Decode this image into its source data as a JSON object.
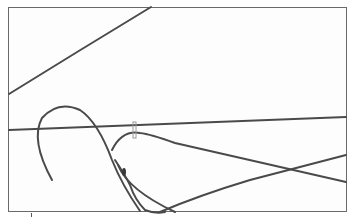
{
  "image": {
    "subject": "wire hangers",
    "description": "Line illustration of tangled wire coat hangers inside a thin rectangular frame",
    "colors": {
      "wire": "#4a4a4a",
      "frame": "#6a6a6a",
      "background": "#fdfdfd",
      "tag": "#9a9a9a"
    }
  }
}
